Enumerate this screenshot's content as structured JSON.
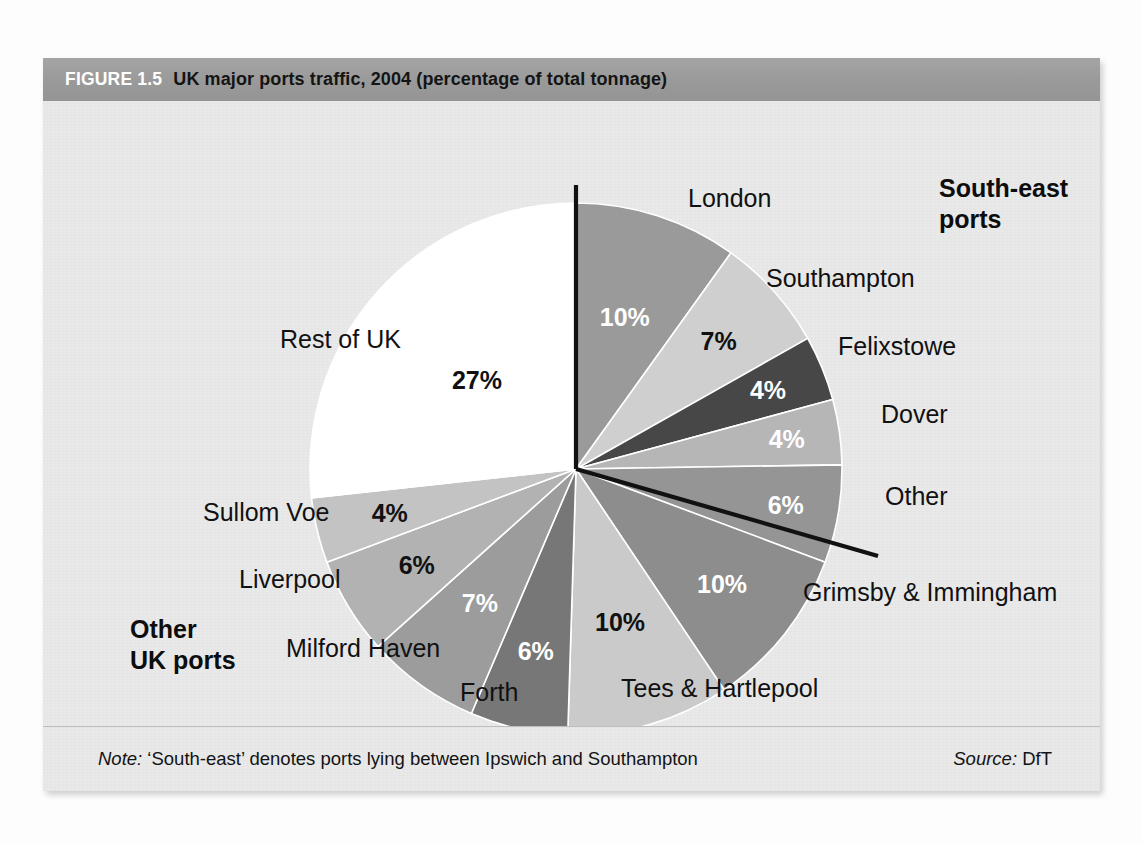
{
  "figure": {
    "tag": "FIGURE 1.5",
    "title": "UK major ports traffic, 2004 (percentage of total tonnage)",
    "note_label": "Note:",
    "note_text": " ‘South-east’ denotes ports lying between Ipswich and Southampton",
    "source_label": "Source:",
    "source_text": " DfT"
  },
  "groups": {
    "south_east": "South-east\nports",
    "south_east_line1": "South-east",
    "south_east_line2": "ports",
    "other_uk_line1": "Other",
    "other_uk_line2": "UK ports"
  },
  "chart_data": {
    "type": "pie",
    "title": "UK major ports traffic, 2004 (percentage of total tonnage)",
    "unit": "percentage of total tonnage",
    "start_angle_deg": 0,
    "direction": "clockwise",
    "total": 101,
    "categories": [
      "London",
      "Southampton",
      "Felixstowe",
      "Dover",
      "Other",
      "Grimsby & Immingham",
      "Tees & Hartlepool",
      "Forth",
      "Milford Haven",
      "Liverpool",
      "Sullom Voe",
      "Rest of UK"
    ],
    "values": [
      10,
      7,
      4,
      4,
      6,
      10,
      10,
      6,
      7,
      6,
      4,
      27
    ],
    "value_labels": [
      "10%",
      "7%",
      "4%",
      "4%",
      "6%",
      "10%",
      "10%",
      "6%",
      "7%",
      "6%",
      "4%",
      "27%"
    ],
    "slices": [
      {
        "label": "London",
        "value": 10,
        "display": "10%",
        "color": "#9a9a9a",
        "label_color": "#ffffff"
      },
      {
        "label": "Southampton",
        "value": 7,
        "display": "7%",
        "color": "#cfcfcf",
        "label_color": "#111111"
      },
      {
        "label": "Felixstowe",
        "value": 4,
        "display": "4%",
        "color": "#474747",
        "label_color": "#ffffff"
      },
      {
        "label": "Dover",
        "value": 4,
        "display": "4%",
        "color": "#b6b6b6",
        "label_color": "#ffffff"
      },
      {
        "label": "Other",
        "value": 6,
        "display": "6%",
        "color": "#959595",
        "label_color": "#ffffff"
      },
      {
        "label": "Grimsby & Immingham",
        "value": 10,
        "display": "10%",
        "color": "#8d8d8d",
        "label_color": "#ffffff"
      },
      {
        "label": "Tees & Hartlepool",
        "value": 10,
        "display": "10%",
        "color": "#cacaca",
        "label_color": "#111111"
      },
      {
        "label": "Forth",
        "value": 6,
        "display": "6%",
        "color": "#777777",
        "label_color": "#ffffff"
      },
      {
        "label": "Milford Haven",
        "value": 7,
        "display": "7%",
        "color": "#9c9c9c",
        "label_color": "#ffffff"
      },
      {
        "label": "Liverpool",
        "value": 6,
        "display": "6%",
        "color": "#b2b2b2",
        "label_color": "#111111"
      },
      {
        "label": "Sullom Voe",
        "value": 4,
        "display": "4%",
        "color": "#c3c3c3",
        "label_color": "#111111"
      },
      {
        "label": "Rest of UK",
        "value": 27,
        "display": "27%",
        "color": "#ffffff",
        "label_color": "#111111"
      }
    ],
    "group_annotations": [
      "South-east ports",
      "Other UK ports"
    ],
    "legend": "none",
    "grid": false
  },
  "colors": {
    "panel_bg": "#e9e9e9",
    "header_bg": "#9b9b9b",
    "divider": "#111111"
  }
}
